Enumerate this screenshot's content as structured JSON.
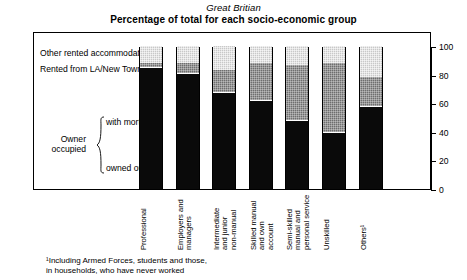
{
  "header": {
    "region": "Great Britian",
    "title": "Percentage of total for each socio-economic group"
  },
  "legend": {
    "other_rented": "Other rented accommodation",
    "rented_la": "Rented from LA/New Town",
    "owner_occupied": "Owner\noccupied",
    "with_mortgage": "with mortgage",
    "owned_outright": "owned outright"
  },
  "footnote": "¹Including Armed Forces, students and those,\nin households, who have never worked",
  "axis": {
    "ticks": [
      "100",
      "80",
      "60",
      "40",
      "20",
      "0"
    ],
    "tick_values": [
      100,
      80,
      60,
      40,
      20,
      0
    ]
  },
  "colors": {
    "owned_outright": "#0a0a0a",
    "with_mortgage": "#0a0a0a",
    "rented_la": "#6e6e6e",
    "other_rented": "#c8c8c8",
    "frame": "#000000",
    "background": "#ffffff"
  },
  "chart_data": {
    "type": "bar",
    "title": "Percentage of total for each socio-economic group",
    "subtitle": "Great Britian",
    "xlabel": "",
    "ylabel": "",
    "ylim": [
      0,
      100
    ],
    "grid": false,
    "legend_position": "left",
    "stacked": true,
    "categories": [
      "Professional",
      "Employers and\nmanagers",
      "Intermediate\nand junior\nnon-manual",
      "Skilled manual\nand own\naccount",
      "Semi-skilled\nmanual and\npersonal service",
      "Unskilled",
      "Others¹"
    ],
    "series": [
      {
        "name": "owned outright",
        "values": [
          27,
          31,
          27,
          21,
          17,
          14,
          32
        ]
      },
      {
        "name": "with mortgage",
        "values": [
          58,
          50,
          41,
          41,
          31,
          26,
          26
        ]
      },
      {
        "name": "Rented from LA/New Town",
        "values": [
          3,
          7,
          15,
          26,
          39,
          48,
          20
        ]
      },
      {
        "name": "Other rented accommodation",
        "values": [
          12,
          12,
          17,
          12,
          13,
          12,
          22
        ]
      }
    ]
  }
}
